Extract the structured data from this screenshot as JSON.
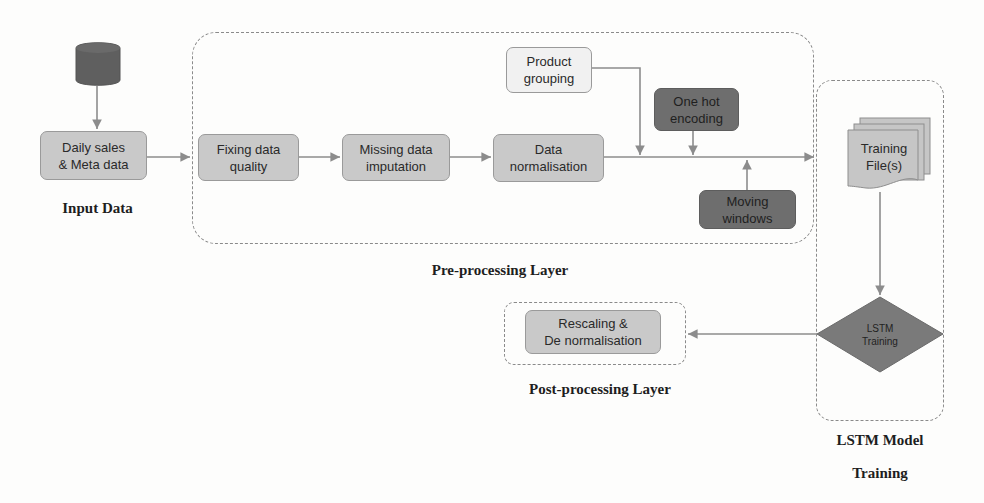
{
  "diagram": {
    "colors": {
      "node_fill": "#c9c9c9",
      "node_light_fill": "#f1f1f1",
      "node_dark_fill": "#6e6e6e",
      "arrow": "#8c8c8c",
      "container_border": "#8a8a8a"
    },
    "input": {
      "source_icon": "database-icon",
      "node": "Daily sales\n& Meta data",
      "label": "Input Data"
    },
    "preprocessing": {
      "label": "Pre-processing Layer",
      "steps": [
        "Fixing data\nquality",
        "Missing data\nimputation",
        "Data\nnormalisation"
      ],
      "side_inputs": {
        "product_grouping": "Product\ngrouping",
        "one_hot": "One hot\nencoding",
        "moving_windows": "Moving\nwindows"
      }
    },
    "lstm": {
      "label_line1": "LSTM Model",
      "label_line2": "Training",
      "training_files": "Training\nFile(s)",
      "training_files_icon": "document-stack-icon",
      "decision": "LSTM\nTraining"
    },
    "postprocessing": {
      "label": "Post-processing Layer",
      "node": "Rescaling &\nDe normalisation"
    }
  }
}
